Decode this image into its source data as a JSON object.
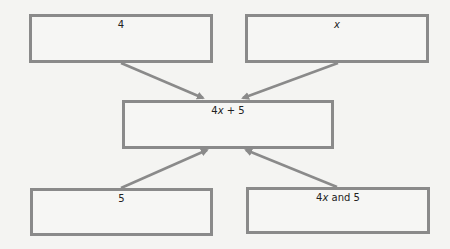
{
  "diagram": {
    "boxes": {
      "top_left": {
        "label": "4"
      },
      "top_right": {
        "label_var": "x"
      },
      "center": {
        "coef": "4",
        "var": "x",
        "rest": " + 5"
      },
      "bottom_left": {
        "label": "5"
      },
      "bottom_right": {
        "coef": "4",
        "var": "x",
        "rest": " and 5"
      }
    },
    "arrows": [
      {
        "from": "top_left",
        "to": "center"
      },
      {
        "from": "top_right",
        "to": "center"
      },
      {
        "from": "bottom_left",
        "to": "center"
      },
      {
        "from": "bottom_right",
        "to": "center"
      }
    ],
    "colors": {
      "border": "#8a8a8a",
      "arrow": "#8a8a8a",
      "background": "#f4f4f2",
      "text": "#222222"
    }
  }
}
